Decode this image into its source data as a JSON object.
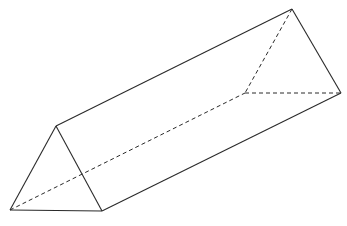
{
  "diagram": {
    "type": "triangular-prism",
    "vertices": {
      "A": [
        10,
        210
      ],
      "B": [
        102,
        211
      ],
      "C": [
        56,
        126
      ],
      "D": [
        292,
        9
      ],
      "E": [
        341,
        93
      ],
      "F": [
        245,
        93
      ]
    },
    "edges": [
      {
        "from": "A",
        "to": "B",
        "style": "solid"
      },
      {
        "from": "B",
        "to": "C",
        "style": "solid"
      },
      {
        "from": "C",
        "to": "A",
        "style": "solid"
      },
      {
        "from": "C",
        "to": "D",
        "style": "solid"
      },
      {
        "from": "B",
        "to": "E",
        "style": "solid"
      },
      {
        "from": "D",
        "to": "E",
        "style": "solid"
      },
      {
        "from": "A",
        "to": "F",
        "style": "dashed"
      },
      {
        "from": "D",
        "to": "F",
        "style": "dashed"
      },
      {
        "from": "F",
        "to": "E",
        "style": "dashed"
      }
    ],
    "colors": {
      "stroke": "#2a2a2a",
      "background": "#ffffff"
    }
  }
}
